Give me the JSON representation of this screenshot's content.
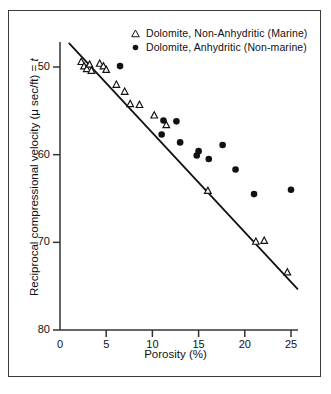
{
  "chart_data": {
    "type": "scatter",
    "title": "",
    "xlabel": "Porosity (%)",
    "ylabel": "Reciprocal compressional velocity  (μ sec/ft) = t",
    "ylabel_prefix": "Reciprocal compressional velocity  (μ sec/ft) = ",
    "ylabel_italic_suffix": "t",
    "xlim": [
      0,
      25
    ],
    "ylim": [
      80,
      50
    ],
    "y_axis_inverted": true,
    "grid": false,
    "xticks": [
      0,
      5,
      10,
      15,
      20,
      25
    ],
    "yticks": [
      50,
      60,
      70,
      80
    ],
    "xtick_labels": [
      "0",
      "5",
      "10",
      "15",
      "20",
      "25"
    ],
    "ytick_labels": [
      "50",
      "60",
      "70",
      "80"
    ],
    "legend_position": "top-right",
    "series": [
      {
        "name": "Dolomite, Non-Anhydritic (Marine)",
        "marker": "triangle-open",
        "color": "#111111",
        "points": [
          [
            2.3,
            49.4
          ],
          [
            2.6,
            49.9
          ],
          [
            2.9,
            50.2
          ],
          [
            3.2,
            49.7
          ],
          [
            3.4,
            50.4
          ],
          [
            4.3,
            49.6
          ],
          [
            4.7,
            49.9
          ],
          [
            5.0,
            50.3
          ],
          [
            6.1,
            52.0
          ],
          [
            7.0,
            52.8
          ],
          [
            7.6,
            54.2
          ],
          [
            8.6,
            54.3
          ],
          [
            10.2,
            55.5
          ],
          [
            11.5,
            56.6
          ],
          [
            16.0,
            64.1
          ],
          [
            21.2,
            69.9
          ],
          [
            22.1,
            69.8
          ],
          [
            24.6,
            73.4
          ]
        ]
      },
      {
        "name": "Dolomite, Anhydritic (Non-marine)",
        "marker": "circle-filled",
        "color": "#111111",
        "points": [
          [
            6.5,
            49.9
          ],
          [
            11.2,
            56.1
          ],
          [
            11.0,
            57.7
          ],
          [
            12.6,
            56.2
          ],
          [
            13.0,
            58.6
          ],
          [
            14.8,
            60.1
          ],
          [
            15.0,
            59.6
          ],
          [
            16.1,
            60.5
          ],
          [
            17.6,
            58.9
          ],
          [
            19.0,
            61.7
          ],
          [
            21.0,
            64.5
          ],
          [
            25.0,
            64.0
          ]
        ]
      }
    ],
    "trendline": {
      "name": "regression-line",
      "x_start": 1.0,
      "y_start": 47.3,
      "x_end": 25.7,
      "y_end": 75.3
    }
  },
  "axes": {
    "x_title": "Porosity (%)",
    "y_title_prefix": "Reciprocal compressional velocity  (μ sec/ft) = ",
    "y_title_italic": "t"
  },
  "legend": {
    "entries": [
      {
        "marker": "triangle-open",
        "label": "Dolomite, Non-Anhydritic (Marine)"
      },
      {
        "marker": "circle-filled",
        "label": "Dolomite, Anhydritic (Non-marine)"
      }
    ]
  }
}
